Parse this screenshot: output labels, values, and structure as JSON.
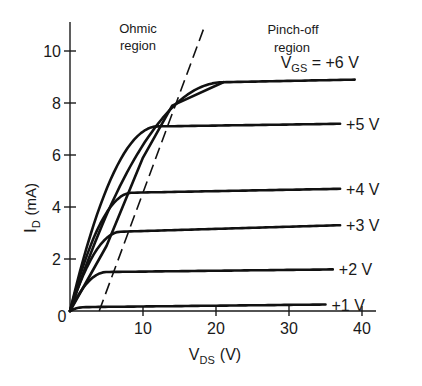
{
  "chart_data": {
    "type": "line",
    "title": "",
    "xlabel": "V_DS (V)",
    "xlabel_main": "V",
    "xlabel_sub": "DS",
    "xlabel_unit": "(V)",
    "ylabel": "I_D (mA)",
    "ylabel_main": "I",
    "ylabel_sub": "D",
    "ylabel_unit": "(mA)",
    "xlim": [
      0,
      40
    ],
    "ylim": [
      0,
      11
    ],
    "xticks": [
      10,
      20,
      30,
      40
    ],
    "yticks": [
      2,
      4,
      6,
      8,
      10
    ],
    "origin_label": "0",
    "grid": false,
    "annotations": [
      {
        "id": "ohmic",
        "line1": "Ohmic",
        "line2": "region"
      },
      {
        "id": "pinch",
        "line1": "Pinch-off",
        "line2": "region"
      }
    ],
    "boundary": {
      "name": "pinch-off boundary",
      "style": "dashed",
      "points": [
        [
          4,
          0
        ],
        [
          18.5,
          11
        ]
      ]
    },
    "series": [
      {
        "name": "V_GS = +6 V",
        "label": "+6 V",
        "label_prefix_main": "V",
        "label_prefix_sub": "GS",
        "label_prefix_eq": " = ",
        "vsat": 21,
        "isat": 8.8,
        "iend": 8.9,
        "xend": 39
      },
      {
        "name": "+5 V",
        "label": "+5 V",
        "vsat": 12,
        "isat": 7.1,
        "iend": 7.2,
        "xend": 37
      },
      {
        "name": "+4 V",
        "label": "+4 V",
        "vsat": 8.5,
        "isat": 4.55,
        "iend": 4.7,
        "xend": 37
      },
      {
        "name": "+3 V",
        "label": "+3 V",
        "vsat": 7,
        "isat": 3.05,
        "iend": 3.3,
        "xend": 37
      },
      {
        "name": "+2 V",
        "label": "+2 V",
        "vsat": 5,
        "isat": 1.5,
        "iend": 1.6,
        "xend": 36
      },
      {
        "name": "+1 V",
        "label": "+1 V",
        "vsat": 2,
        "isat": 0.15,
        "iend": 0.25,
        "xend": 35
      }
    ]
  }
}
